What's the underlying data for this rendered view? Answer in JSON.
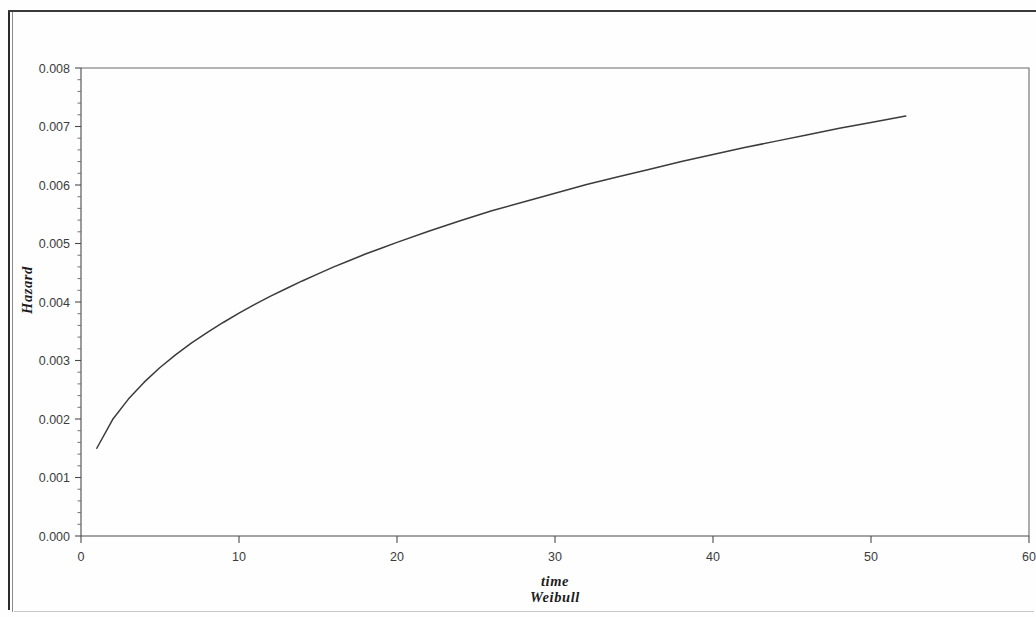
{
  "chart_data": {
    "type": "line",
    "title": "",
    "subtitle": "",
    "xlabel": "time",
    "ylabel": "Hazard",
    "footnote": "Weibull",
    "xlim": [
      0,
      60
    ],
    "ylim": [
      0.0,
      0.008
    ],
    "grid": false,
    "legend": null,
    "x_ticks": [
      0,
      10,
      20,
      30,
      40,
      50,
      60
    ],
    "x_tick_labels": [
      "0",
      "10",
      "20",
      "30",
      "40",
      "50",
      "60"
    ],
    "y_ticks": [
      0.0,
      0.001,
      0.002,
      0.003,
      0.004,
      0.005,
      0.006,
      0.007,
      0.008
    ],
    "y_tick_labels": [
      "0.000",
      "0.001",
      "0.002",
      "0.003",
      "0.004",
      "0.005",
      "0.006",
      "0.007",
      "0.008"
    ],
    "y_minor_ticks_per_interval": 5,
    "x_minor_ticks_per_interval": 1,
    "series": [
      {
        "name": "Weibull hazard",
        "color": "#3b3b3b",
        "x": [
          1,
          2,
          3,
          4,
          5,
          6,
          7,
          8,
          9,
          10,
          11,
          12,
          13,
          14,
          15,
          16,
          17,
          18,
          19,
          20,
          22,
          24,
          26,
          28,
          30,
          32,
          34,
          36,
          38,
          40,
          42,
          44,
          46,
          48,
          50,
          52.2
        ],
        "y": [
          0.0015,
          0.00199,
          0.00234,
          0.00263,
          0.00288,
          0.0031,
          0.0033,
          0.00348,
          0.00365,
          0.00381,
          0.00396,
          0.0041,
          0.00423,
          0.00436,
          0.00448,
          0.0046,
          0.00471,
          0.00482,
          0.00492,
          0.00502,
          0.00521,
          0.00539,
          0.00556,
          0.00571,
          0.00586,
          0.00601,
          0.00614,
          0.00627,
          0.0064,
          0.00652,
          0.00664,
          0.00675,
          0.00686,
          0.00697,
          0.00707,
          0.00718
        ]
      }
    ]
  },
  "axis": {
    "y_label": "Hazard",
    "x_label": "time",
    "footnote_label": "Weibull"
  }
}
